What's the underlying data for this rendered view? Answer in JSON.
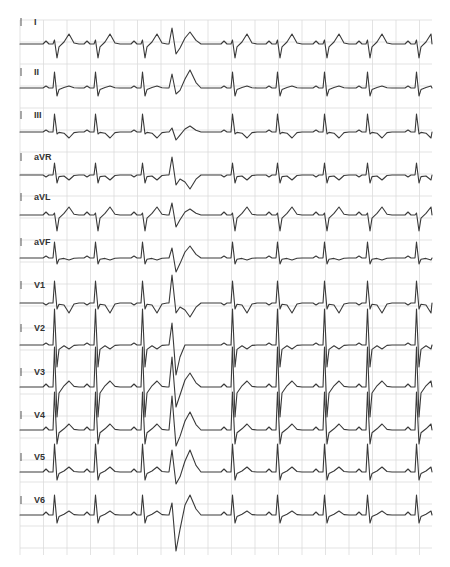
{
  "chart_data": {
    "type": "line",
    "layout": "12 leads stacked vertically, single rhythm strip per lead",
    "grid": true,
    "grid_color": "#dcdcdc",
    "trace_color": "#3a3a3a",
    "x_range_px": [
      20,
      432
    ],
    "beat_positions_px": [
      55,
      96,
      143,
      173,
      233,
      278,
      325,
      368,
      417
    ],
    "premature_beat_index": 3,
    "annotations": [
      "Wide-complex premature ventricular beat in 4th complex across all leads"
    ],
    "leads": [
      {
        "name": "I",
        "label_y": 22,
        "baseline_y": 44,
        "qrs": "rS",
        "r": 4,
        "s": 14,
        "t": 10,
        "p": 3,
        "pvc_r": 16,
        "pvc_s": 10,
        "pvc_t": 12
      },
      {
        "name": "II",
        "label_y": 72,
        "baseline_y": 88,
        "qrs": "Rs",
        "r": 16,
        "s": 8,
        "t": 2,
        "p": 2,
        "pvc_r": 14,
        "pvc_s": 6,
        "pvc_t": 18
      },
      {
        "name": "III",
        "label_y": 115,
        "baseline_y": 132,
        "qrs": "R",
        "r": 18,
        "s": 2,
        "t": -6,
        "p": 2,
        "pvc_r": 4,
        "pvc_s": 8,
        "pvc_t": 6
      },
      {
        "name": "aVR",
        "label_y": 157,
        "baseline_y": 175,
        "qrs": "qR",
        "r": 12,
        "s": 8,
        "t": -5,
        "p": -2,
        "pvc_r": 18,
        "pvc_s": 10,
        "pvc_t": -14
      },
      {
        "name": "aVL",
        "label_y": 197,
        "baseline_y": 215,
        "qrs": "rS",
        "r": 2,
        "s": 16,
        "t": 8,
        "p": 3,
        "pvc_r": 12,
        "pvc_s": 12,
        "pvc_t": 6
      },
      {
        "name": "aVF",
        "label_y": 242,
        "baseline_y": 258,
        "qrs": "Rs",
        "r": 16,
        "s": 6,
        "t": -2,
        "p": 2,
        "pvc_r": 10,
        "pvc_s": 14,
        "pvc_t": 12
      },
      {
        "name": "V1",
        "label_y": 285,
        "baseline_y": 303,
        "qrs": "rSR",
        "r": 22,
        "s": 6,
        "t": -10,
        "p": -2,
        "pvc_r": 28,
        "pvc_s": 10,
        "pvc_t": -14
      },
      {
        "name": "V2",
        "label_y": 328,
        "baseline_y": 345,
        "qrs": "RS",
        "r": 36,
        "s": 22,
        "t": -4,
        "p": 2,
        "pvc_r": 22,
        "pvc_s": 30,
        "pvc_t": 0
      },
      {
        "name": "V3",
        "label_y": 372,
        "baseline_y": 387,
        "qrs": "RS",
        "r": 40,
        "s": 30,
        "t": 6,
        "p": 3,
        "pvc_r": 30,
        "pvc_s": 20,
        "pvc_t": 14
      },
      {
        "name": "V4",
        "label_y": 415,
        "baseline_y": 430,
        "qrs": "RS",
        "r": 38,
        "s": 14,
        "t": 6,
        "p": 3,
        "pvc_r": 34,
        "pvc_s": 16,
        "pvc_t": 18
      },
      {
        "name": "V5",
        "label_y": 457,
        "baseline_y": 472,
        "qrs": "Rs",
        "r": 28,
        "s": 8,
        "t": 5,
        "p": 3,
        "pvc_r": 22,
        "pvc_s": 12,
        "pvc_t": 22
      },
      {
        "name": "V6",
        "label_y": 500,
        "baseline_y": 515,
        "qrs": "Rs",
        "r": 20,
        "s": 8,
        "t": 4,
        "p": 3,
        "pvc_r": 12,
        "pvc_s": 36,
        "pvc_t": 20
      }
    ],
    "grid_spec": {
      "x_start": 20,
      "x_end": 432,
      "x_step": 23.5,
      "y_start": 20,
      "y_end": 555,
      "y_step": 22
    }
  }
}
